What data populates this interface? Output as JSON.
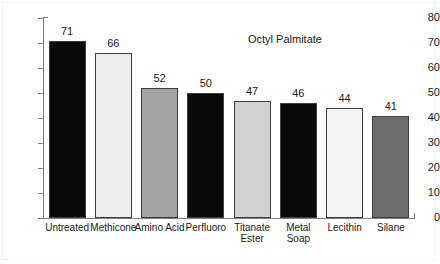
{
  "chart_data": {
    "type": "bar",
    "title": "Octyl Palmitate",
    "xlabel": "",
    "ylabel": "",
    "ylim": [
      0,
      80
    ],
    "yticks": [
      0,
      10,
      20,
      30,
      40,
      50,
      60,
      70,
      80
    ],
    "grid": false,
    "legend": "none",
    "categories": [
      "Untreated",
      "Methicone",
      "Amino Acid",
      "Perfluoro",
      "Titanate Ester",
      "Metal Soap",
      "Lecithin",
      "Silane"
    ],
    "category_lines": [
      [
        "Untreated"
      ],
      [
        "Methicone"
      ],
      [
        "Amino Acid"
      ],
      [
        "Perfluoro"
      ],
      [
        "Titanate",
        "Ester"
      ],
      [
        "Metal",
        "Soap"
      ],
      [
        "Lecithin"
      ],
      [
        "Silane"
      ]
    ],
    "values": [
      71,
      66,
      52,
      50,
      47,
      46,
      44,
      41
    ],
    "bar_colors": [
      "#0a0a0a",
      "#ededed",
      "#a3a3a3",
      "#0a0a0a",
      "#d2d2d2",
      "#0a0a0a",
      "#f4f4f4",
      "#6e6e6e"
    ],
    "bar_edge_color": "#3d3d3d",
    "axis_color": "#808080",
    "text_color": "#1a1a1a"
  }
}
